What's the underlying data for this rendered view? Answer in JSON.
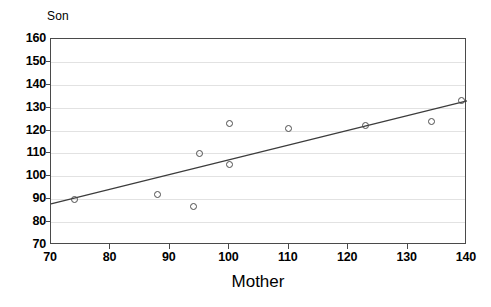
{
  "chart_data": {
    "type": "scatter",
    "title": "",
    "xlabel": "Mother",
    "ylabel": "Son",
    "xlim": [
      70,
      140
    ],
    "ylim": [
      70,
      160
    ],
    "xticks": [
      70,
      80,
      90,
      100,
      110,
      120,
      130,
      140
    ],
    "yticks": [
      70,
      80,
      90,
      100,
      110,
      120,
      130,
      140,
      150,
      160
    ],
    "grid": true,
    "grid_axis": "y",
    "legend": "none",
    "marker": "open-circle",
    "series": [
      {
        "name": "Mother-Son heights",
        "points": [
          {
            "x": 74,
            "y": 90
          },
          {
            "x": 88,
            "y": 92
          },
          {
            "x": 94,
            "y": 87
          },
          {
            "x": 95,
            "y": 110
          },
          {
            "x": 100,
            "y": 105
          },
          {
            "x": 100,
            "y": 123
          },
          {
            "x": 110,
            "y": 121
          },
          {
            "x": 123,
            "y": 122
          },
          {
            "x": 134,
            "y": 124
          },
          {
            "x": 139,
            "y": 133
          }
        ]
      }
    ],
    "fit_line": {
      "name": "regression line",
      "x_start": 70,
      "y_start": 88,
      "x_end": 140,
      "y_end": 133,
      "color": "#3c3c3c"
    },
    "colors": {
      "axis": "#4a4a4a",
      "grid": "#e2e2e2",
      "marker_edge": "#4d4d4d",
      "line": "#3c3c3c",
      "background": "#ffffff",
      "text": "#000000"
    }
  }
}
